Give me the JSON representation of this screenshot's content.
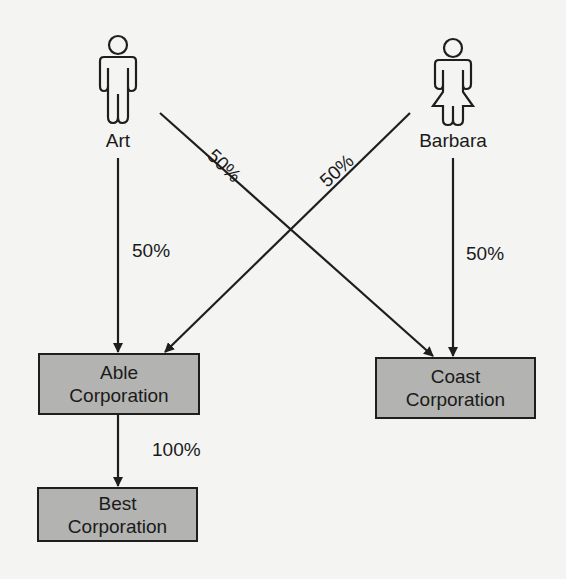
{
  "diagram": {
    "type": "ownership-structure",
    "colors": {
      "background": "#f4f4f2",
      "box_fill": "#b3b3b1",
      "line": "#1e1e1e"
    },
    "people": [
      {
        "id": "art",
        "label": "Art",
        "icon": "male-person-icon"
      },
      {
        "id": "barbara",
        "label": "Barbara",
        "icon": "female-person-icon"
      }
    ],
    "entities": [
      {
        "id": "able",
        "line1": "Able",
        "line2": "Corporation"
      },
      {
        "id": "coast",
        "line1": "Coast",
        "line2": "Corporation"
      },
      {
        "id": "best",
        "line1": "Best",
        "line2": "Corporation"
      }
    ],
    "edges": [
      {
        "from": "Art",
        "to": "Able Corporation",
        "label": "50%"
      },
      {
        "from": "Art",
        "to": "Coast Corporation",
        "label": "50%"
      },
      {
        "from": "Barbara",
        "to": "Able Corporation",
        "label": "50%"
      },
      {
        "from": "Barbara",
        "to": "Coast Corporation",
        "label": "50%"
      },
      {
        "from": "Able Corporation",
        "to": "Best Corporation",
        "label": "100%"
      }
    ]
  }
}
